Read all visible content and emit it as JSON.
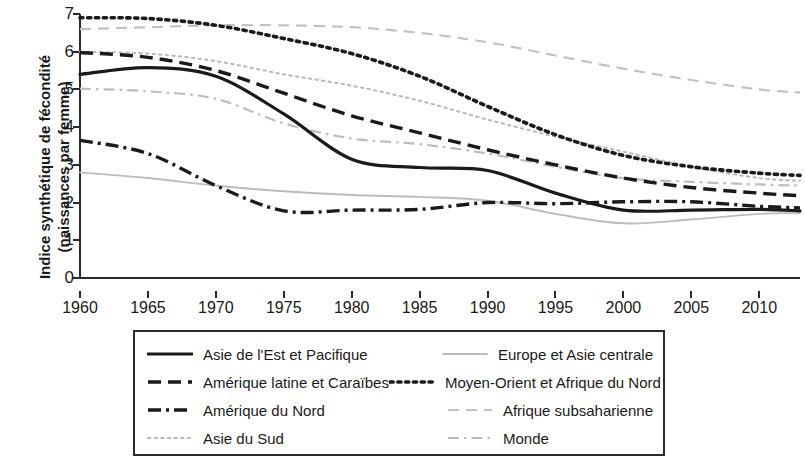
{
  "chart_data": {
    "type": "line",
    "title": "",
    "xlabel": "",
    "ylabel": "Indice synthétique de fécondité (naissances par femme)",
    "ylabel_line1": "Indice synthétique de fécondité",
    "ylabel_line2": "(naissances par femme)",
    "xlim": [
      1960,
      2013
    ],
    "ylim": [
      0,
      7
    ],
    "grid": false,
    "legend_position": "below-plot",
    "y_ticks": [
      "0",
      "1",
      "2",
      "3",
      "4",
      "5",
      "6",
      "7"
    ],
    "x_ticks": [
      "1960",
      "1965",
      "1970",
      "1975",
      "1980",
      "1985",
      "1990",
      "1995",
      "2000",
      "2005",
      "2010"
    ],
    "x": [
      1960,
      1965,
      1970,
      1975,
      1980,
      1985,
      1990,
      1995,
      2000,
      2005,
      2010,
      2013
    ],
    "series": [
      {
        "name": "Asie de l'Est et Pacifique",
        "style": "solid",
        "color": "#1a1a1a",
        "values": [
          5.4,
          5.58,
          5.35,
          4.35,
          3.15,
          2.93,
          2.85,
          2.25,
          1.8,
          1.8,
          1.82,
          1.78
        ]
      },
      {
        "name": "Amérique latine et Caraïbes",
        "style": "dashed",
        "color": "#1a1a1a",
        "values": [
          5.98,
          5.85,
          5.5,
          4.9,
          4.3,
          3.85,
          3.4,
          3.0,
          2.65,
          2.4,
          2.25,
          2.18
        ]
      },
      {
        "name": "Amérique du Nord",
        "style": "dash-dot",
        "color": "#1a1a1a",
        "values": [
          3.65,
          3.3,
          2.45,
          1.78,
          1.8,
          1.82,
          2.0,
          1.97,
          2.02,
          2.02,
          1.9,
          1.86
        ]
      },
      {
        "name": "Asie du Sud",
        "style": "dotted-fine",
        "color": "#b8b8b8",
        "values": [
          6.0,
          5.95,
          5.75,
          5.4,
          5.1,
          4.7,
          4.2,
          3.75,
          3.35,
          2.95,
          2.65,
          2.58
        ]
      },
      {
        "name": "Europe et Asie centrale",
        "style": "solid-light",
        "color": "#bcbcbc",
        "values": [
          2.8,
          2.65,
          2.45,
          2.3,
          2.2,
          2.15,
          2.05,
          1.7,
          1.45,
          1.55,
          1.7,
          1.72
        ]
      },
      {
        "name": "Moyen-Orient et Afrique du Nord",
        "style": "dotted-bold",
        "color": "#1a1a1a",
        "values": [
          6.9,
          6.88,
          6.7,
          6.35,
          5.95,
          5.35,
          4.55,
          3.8,
          3.25,
          2.95,
          2.78,
          2.72
        ]
      },
      {
        "name": "Afrique subsaharienne",
        "style": "dashed-light",
        "color": "#c2c2c2",
        "values": [
          6.6,
          6.65,
          6.7,
          6.7,
          6.65,
          6.5,
          6.25,
          5.9,
          5.55,
          5.25,
          5.0,
          4.92
        ]
      },
      {
        "name": "Monde",
        "style": "dash-dot-light",
        "color": "#bdbdbd",
        "values": [
          5.02,
          4.95,
          4.75,
          4.1,
          3.7,
          3.55,
          3.3,
          2.95,
          2.65,
          2.55,
          2.48,
          2.45
        ]
      }
    ]
  },
  "legend": {
    "rows": [
      {
        "left": "Asie de l'Est et Pacifique",
        "right": "Europe et Asie centrale"
      },
      {
        "left": "Amérique latine et Caraïbes",
        "right": "Moyen-Orient et Afrique du Nord"
      },
      {
        "left": "Amérique du Nord",
        "right": "Afrique subsaharienne"
      },
      {
        "left": "Asie du Sud",
        "right": "Monde"
      }
    ]
  },
  "colors": {
    "dark": "#1a1a1a",
    "light": "#bdbdbd",
    "axis": "#2b2b2b",
    "background": "#ffffff"
  }
}
